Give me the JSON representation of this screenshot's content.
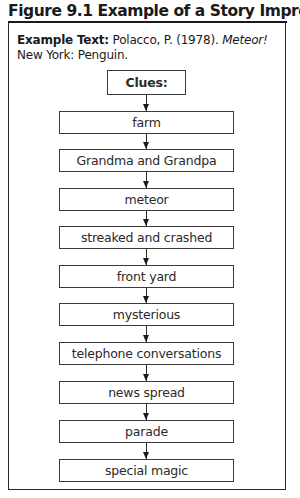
{
  "figure": {
    "title": "Figure 9.1 Example of a Story Impression",
    "reference_label": "Example Text:",
    "reference_author": " Polacco, P. (1978). ",
    "reference_title": "Meteor!",
    "reference_publisher": "New York: Penguin."
  },
  "flow": {
    "header": "Clues:",
    "clues": [
      "farm",
      "Grandma and Grandpa",
      "meteor",
      "streaked and crashed",
      "front yard",
      "mysterious",
      "telephone conversations",
      "news spread",
      "parade",
      "special magic"
    ]
  }
}
